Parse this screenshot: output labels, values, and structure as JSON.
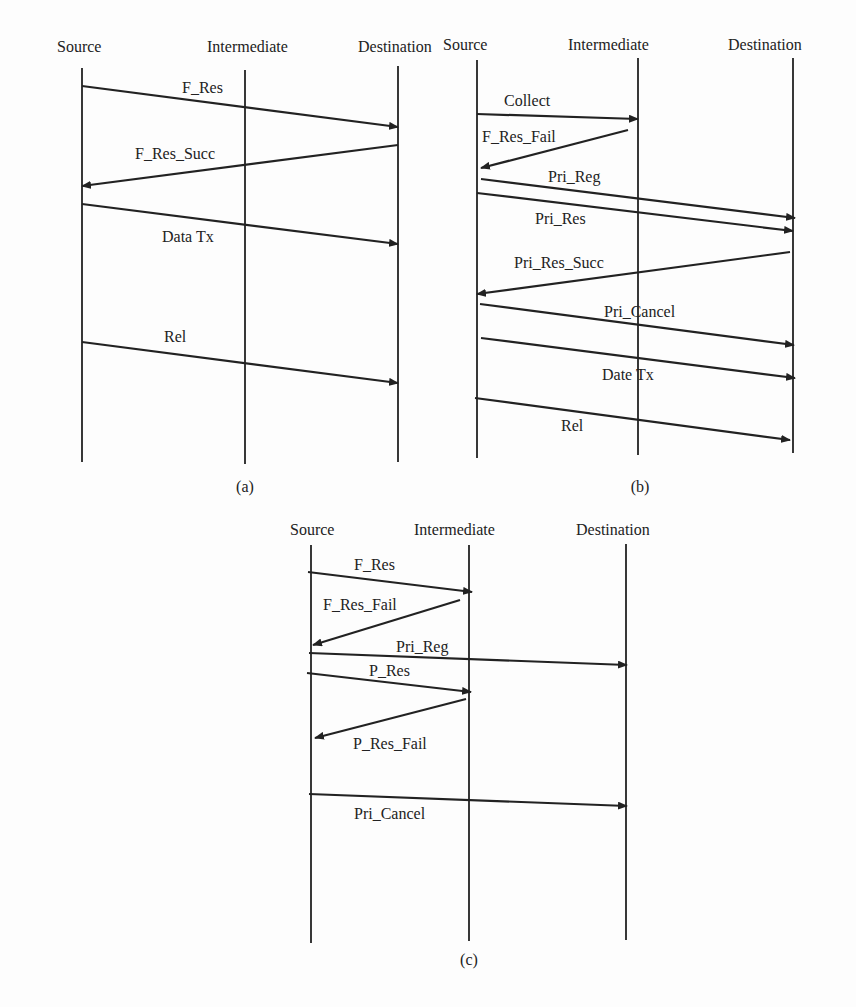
{
  "panels": [
    {
      "id": "a",
      "caption": "(a)",
      "caption_pos": [
        245,
        492
      ],
      "lifelines": [
        {
          "label": "Source",
          "x": 82,
          "label_x": 57,
          "top": 68,
          "bottom": 462
        },
        {
          "label": "Intermediate",
          "x": 245,
          "label_x": 207,
          "top": 70,
          "bottom": 464
        },
        {
          "label": "Destination",
          "x": 398,
          "label_x": 358,
          "top": 66,
          "bottom": 462
        }
      ],
      "label_y": 52,
      "messages": [
        {
          "label": "F_Res",
          "from": [
            82,
            86
          ],
          "to": [
            398,
            127
          ],
          "label_pos": [
            182,
            93
          ]
        },
        {
          "label": "F_Res_Succ",
          "from": [
            398,
            145
          ],
          "to": [
            82,
            186
          ],
          "label_pos": [
            135,
            159
          ]
        },
        {
          "label": "Data Tx",
          "from": [
            82,
            204
          ],
          "to": [
            398,
            244
          ],
          "label_pos": [
            162,
            242
          ]
        },
        {
          "label": "Rel",
          "from": [
            82,
            342
          ],
          "to": [
            398,
            383
          ],
          "label_pos": [
            164,
            342
          ]
        }
      ]
    },
    {
      "id": "b",
      "caption": "(b)",
      "caption_pos": [
        640,
        492
      ],
      "lifelines": [
        {
          "label": "Source",
          "x": 477,
          "label_x": 443,
          "top": 60,
          "bottom": 458
        },
        {
          "label": "Intermediate",
          "x": 638,
          "label_x": 568,
          "top": 58,
          "bottom": 455
        },
        {
          "label": "Destination",
          "x": 793,
          "label_x": 728,
          "top": 58,
          "bottom": 453
        }
      ],
      "label_y": 50,
      "messages": [
        {
          "label": "Collect",
          "from": [
            477,
            114
          ],
          "to": [
            638,
            119
          ],
          "label_pos": [
            504,
            106
          ]
        },
        {
          "label": "F_Res_Fail",
          "from": [
            628,
            130
          ],
          "to": [
            481,
            168
          ],
          "label_pos": [
            482,
            142
          ]
        },
        {
          "label": "Pri_Reg",
          "from": [
            481,
            179
          ],
          "to": [
            795,
            218
          ],
          "label_pos": [
            548,
            182
          ]
        },
        {
          "label": "Pri_Res",
          "from": [
            477,
            193
          ],
          "to": [
            793,
            231
          ],
          "label_pos": [
            535,
            224
          ]
        },
        {
          "label": "Pri_Res_Succ",
          "from": [
            790,
            252
          ],
          "to": [
            477,
            294
          ],
          "label_pos": [
            514,
            268
          ]
        },
        {
          "label": "Pri_Cancel",
          "from": [
            480,
            304
          ],
          "to": [
            794,
            345
          ],
          "label_pos": [
            604,
            317
          ]
        },
        {
          "label": "Date Tx",
          "from": [
            481,
            338
          ],
          "to": [
            795,
            378
          ],
          "label_pos": [
            602,
            380
          ]
        },
        {
          "label": "Rel",
          "from": [
            475,
            398
          ],
          "to": [
            790,
            440
          ],
          "label_pos": [
            561,
            431
          ]
        }
      ]
    },
    {
      "id": "c",
      "caption": "(c)",
      "caption_pos": [
        469,
        965
      ],
      "lifelines": [
        {
          "label": "Source",
          "x": 311,
          "label_x": 290,
          "top": 545,
          "bottom": 943
        },
        {
          "label": "Intermediate",
          "x": 469,
          "label_x": 414,
          "top": 545,
          "bottom": 941
        },
        {
          "label": "Destination",
          "x": 626,
          "label_x": 576,
          "top": 544,
          "bottom": 940
        }
      ],
      "label_y": 535,
      "messages": [
        {
          "label": "F_Res",
          "from": [
            308,
            572
          ],
          "to": [
            472,
            592
          ],
          "label_pos": [
            354,
            570
          ]
        },
        {
          "label": "F_Res_Fail",
          "from": [
            460,
            600
          ],
          "to": [
            313,
            645
          ],
          "label_pos": [
            323,
            610
          ]
        },
        {
          "label": "Pri_Reg",
          "from": [
            309,
            653
          ],
          "to": [
            627,
            665
          ],
          "label_pos": [
            396,
            652
          ]
        },
        {
          "label": "P_Res",
          "from": [
            307,
            673
          ],
          "to": [
            471,
            692
          ],
          "label_pos": [
            369,
            676
          ]
        },
        {
          "label": "P_Res_Fail",
          "from": [
            466,
            699
          ],
          "to": [
            315,
            738
          ],
          "label_pos": [
            353,
            749
          ]
        },
        {
          "label": "Pri_Cancel",
          "from": [
            309,
            794
          ],
          "to": [
            627,
            806
          ],
          "label_pos": [
            354,
            819
          ]
        }
      ]
    }
  ]
}
